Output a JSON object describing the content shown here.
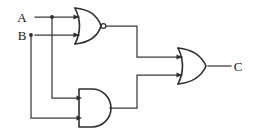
{
  "diagram": {
    "type": "logic-circuit",
    "background_color": "#ffffff",
    "line_color": "#3a3a3a",
    "gate_color": "#2e2e2e",
    "label_color": "#1a1a1a"
  },
  "inputs": [
    {
      "id": "A",
      "label": "A",
      "x": 22,
      "y": 17
    },
    {
      "id": "B",
      "label": "B",
      "x": 22,
      "y": 35
    }
  ],
  "outputs": [
    {
      "id": "C",
      "label": "C",
      "x": 236,
      "y": 64
    }
  ],
  "gates": [
    {
      "id": "gate-nor",
      "type": "NOR",
      "label": "NOR",
      "inverted_output": true,
      "inputs": [
        "A",
        "B"
      ],
      "output": "nor_out"
    },
    {
      "id": "gate-and",
      "type": "AND",
      "label": "AND",
      "inverted_output": false,
      "inputs": [
        "A",
        "B"
      ],
      "output": "and_out"
    },
    {
      "id": "gate-or",
      "type": "OR",
      "label": "OR",
      "inverted_output": false,
      "inputs": [
        "nor_out",
        "and_out"
      ],
      "output": "C"
    }
  ],
  "junctions": [
    {
      "id": "junction-a",
      "source": "A",
      "x": 52,
      "y": 17
    },
    {
      "id": "junction-b",
      "source": "B",
      "x": 31,
      "y": 35
    }
  ],
  "expression": "C = (A NOR B) OR (A AND B)"
}
